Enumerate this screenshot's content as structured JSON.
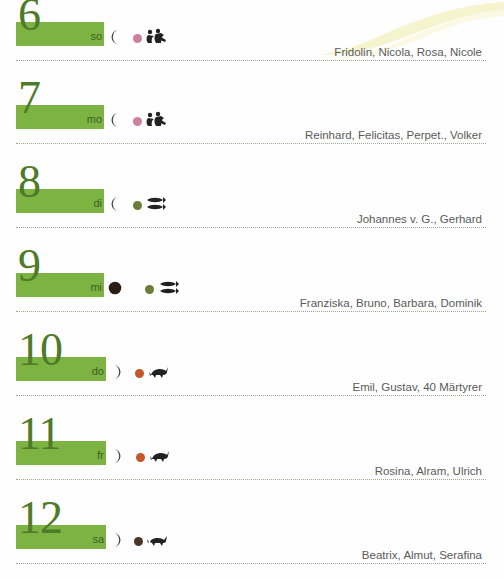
{
  "page": {
    "accent_green": "#7cb342",
    "number_color": "#4f7a28",
    "name_text_color": "#5a5a5a",
    "separator_color": "#9aaa8e",
    "swoosh_color": "#f2f0bf"
  },
  "days": [
    {
      "number": "6",
      "weekday": "so",
      "moon": "waning-crescent-moon",
      "zodiac_dot_color": "#cc7f9e",
      "zodiac_icon": "gemini-twins-icon",
      "names": "Fridolin, Nicola, Rosa, Nicole"
    },
    {
      "number": "7",
      "weekday": "mo",
      "moon": "waning-crescent-moon",
      "zodiac_dot_color": "#cc7f9e",
      "zodiac_icon": "gemini-twins-icon",
      "names": "Reinhard, Felicitas, Perpet., Volker"
    },
    {
      "number": "8",
      "weekday": "di",
      "moon": "waning-crescent-moon",
      "zodiac_dot_color": "#6b7b3a",
      "zodiac_icon": "pisces-fish-icon",
      "names": "Johannes v. G., Gerhard"
    },
    {
      "number": "9",
      "weekday": "mi",
      "moon": "new-moon",
      "zodiac_dot_color": "#6b7b3a",
      "zodiac_icon": "pisces-fish-icon",
      "names": "Franziska, Bruno, Barbara, Dominik"
    },
    {
      "number": "10",
      "weekday": "do",
      "moon": "waxing-crescent-moon",
      "zodiac_dot_color": "#c4562a",
      "zodiac_icon": "aries-ram-icon",
      "names": "Emil, Gustav, 40 Märtyrer"
    },
    {
      "number": "11",
      "weekday": "fr",
      "moon": "waxing-crescent-moon",
      "zodiac_dot_color": "#c4562a",
      "zodiac_icon": "aries-ram-icon",
      "names": "Rosina, Alram, Ulrich"
    },
    {
      "number": "12",
      "weekday": "sa",
      "moon": "waxing-crescent-moon",
      "zodiac_dot_color": "#4a3728",
      "zodiac_icon": "taurus-bull-icon",
      "names": "Beatrix, Almut, Serafina"
    }
  ]
}
